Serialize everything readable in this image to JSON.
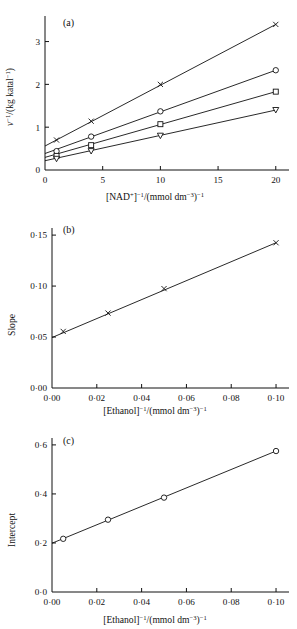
{
  "figure": {
    "name": "enzyme-kinetics-double-reciprocal-plots",
    "background": "#ffffff",
    "ink": "#111111"
  },
  "panels": [
    {
      "id": "a",
      "label": "(a)",
      "ylabel_parts": {
        "v": "v",
        "v_sup": "−1",
        "rest": "/(kg katal",
        "rest_sup": "−1",
        "close": ")"
      },
      "xlabel_parts": {
        "lead": "[NAD",
        "lead_sup": "+",
        "mid_sup": "−1",
        "mid": "/(mmol dm",
        "dm_sup": "−3",
        "close": ")",
        "close_sup": "−1"
      },
      "xticks": [
        "0",
        "5",
        "10",
        "15",
        "20"
      ],
      "yticks": [
        "0",
        "1",
        "2",
        "3"
      ]
    },
    {
      "id": "b",
      "label": "(b)",
      "ylabel": "Slope",
      "xlabel_parts": {
        "lead": "[Ethanol]",
        "lead_sup": "−1",
        "mid": "/(mmol dm",
        "dm_sup": "−3",
        "close": ")",
        "close_sup": "−1"
      },
      "xticks": [
        "0·00",
        "0·02",
        "0·04",
        "0·06",
        "0·08",
        "0·10"
      ],
      "yticks": [
        "0·00",
        "0·05",
        "0·10",
        "0·15"
      ]
    },
    {
      "id": "c",
      "label": "(c)",
      "ylabel": "Intercept",
      "xlabel_parts": {
        "lead": "[Ethanol]",
        "lead_sup": "−1",
        "mid": "/(mmol dm",
        "dm_sup": "−3",
        "close": ")",
        "close_sup": "−1"
      },
      "xticks": [
        "0·00",
        "0·02",
        "0·04",
        "0·06",
        "0·08",
        "0·10"
      ],
      "yticks": [
        "0·0",
        "0·2",
        "0·4",
        "0·6"
      ]
    }
  ],
  "chart_data": [
    {
      "type": "line",
      "panel": "a",
      "title": "(a)",
      "xlabel": "[NAD+]^-1/(mmol dm^-3)^-1",
      "ylabel": "v^-1/(kg katal^-1)",
      "xlim": [
        0,
        20.8
      ],
      "ylim": [
        0,
        3.55
      ],
      "xticks": [
        0,
        5,
        10,
        15,
        20
      ],
      "yticks": [
        0,
        1,
        2,
        3
      ],
      "grid": false,
      "legend": "none",
      "series": [
        {
          "name": "ethanol-inverse-0.100",
          "marker": "cross",
          "x": [
            1.0,
            4.0,
            10.0,
            20.0
          ],
          "y": [
            0.7,
            1.14,
            2.0,
            3.4
          ],
          "intercept": 0.56,
          "slope": 0.1425
        },
        {
          "name": "ethanol-inverse-0.050",
          "marker": "circle",
          "x": [
            1.0,
            4.0,
            10.0,
            20.0
          ],
          "y": [
            0.44,
            0.78,
            1.37,
            2.33
          ],
          "intercept": 0.385,
          "slope": 0.0975
        },
        {
          "name": "ethanol-inverse-0.025",
          "marker": "square",
          "x": [
            1.0,
            4.0,
            10.0,
            20.0
          ],
          "y": [
            0.33,
            0.58,
            1.07,
            1.83
          ],
          "intercept": 0.295,
          "slope": 0.0735
        },
        {
          "name": "ethanol-inverse-0.005",
          "marker": "triangle-down",
          "x": [
            1.0,
            4.0,
            10.0,
            20.0
          ],
          "y": [
            0.26,
            0.44,
            0.8,
            1.4
          ],
          "intercept": 0.217,
          "slope": 0.0555
        }
      ]
    },
    {
      "type": "line",
      "panel": "b",
      "title": "(b)",
      "xlabel": "[Ethanol]^-1/(mmol dm^-3)^-1",
      "ylabel": "Slope",
      "xlim": [
        0,
        0.104
      ],
      "ylim": [
        0,
        0.155
      ],
      "xticks": [
        0.0,
        0.02,
        0.04,
        0.06,
        0.08,
        0.1
      ],
      "yticks": [
        0.0,
        0.05,
        0.1,
        0.15
      ],
      "grid": false,
      "legend": "none",
      "series": [
        {
          "name": "slope-replot",
          "marker": "cross",
          "x": [
            0.005,
            0.025,
            0.05,
            0.1
          ],
          "y": [
            0.0555,
            0.0735,
            0.0975,
            0.1425
          ],
          "intercept": 0.0495,
          "slope": 0.93
        }
      ]
    },
    {
      "type": "line",
      "panel": "c",
      "title": "(c)",
      "xlabel": "[Ethanol]^-1/(mmol dm^-3)^-1",
      "ylabel": "Intercept",
      "xlim": [
        0,
        0.104
      ],
      "ylim": [
        0,
        0.62
      ],
      "xticks": [
        0.0,
        0.02,
        0.04,
        0.06,
        0.08,
        0.1
      ],
      "yticks": [
        0.0,
        0.2,
        0.4,
        0.6
      ],
      "grid": false,
      "legend": "none",
      "series": [
        {
          "name": "intercept-replot",
          "marker": "circle",
          "x": [
            0.005,
            0.025,
            0.05,
            0.1
          ],
          "y": [
            0.217,
            0.295,
            0.385,
            0.575
          ],
          "intercept": 0.199,
          "slope": 3.75
        }
      ]
    }
  ]
}
